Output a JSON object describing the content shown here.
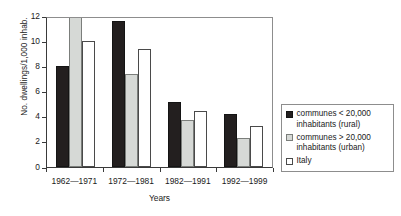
{
  "chart_data": {
    "type": "bar",
    "title": "",
    "subtitle": "",
    "xlabel": "Years",
    "ylabel": "No. dwellings/1,000 inhab.",
    "categories": [
      "1962—1971",
      "1972—1981",
      "1982—1991",
      "1992—1999"
    ],
    "series": [
      {
        "name": "communes < 20,000 inhabitants (rural)",
        "color": "#231f1f",
        "values": [
          8.0,
          11.6,
          5.2,
          4.25
        ]
      },
      {
        "name": "communes > 20,000 inhabitants (urban)",
        "color": "#d6d9d6",
        "values": [
          12.6,
          7.4,
          3.7,
          2.3
        ]
      },
      {
        "name": "Italy",
        "color": "#ffffff",
        "values": [
          10.0,
          9.35,
          4.45,
          3.25
        ]
      }
    ],
    "ylim": [
      0,
      12
    ],
    "yticks": [
      0,
      2,
      4,
      6,
      8,
      10,
      12
    ],
    "ytick_labels": [
      "0",
      "2",
      "4",
      "6",
      "8",
      "10",
      "12"
    ],
    "grid": false,
    "legend_position": "right"
  },
  "legend": {
    "entries": [
      {
        "label_line1": "communes < 20,000",
        "label_line2": "inhabitants (rural)"
      },
      {
        "label_line1": "communes > 20,000",
        "label_line2": "inhabitants (urban)"
      },
      {
        "label_line1": "Italy",
        "label_line2": ""
      }
    ]
  }
}
